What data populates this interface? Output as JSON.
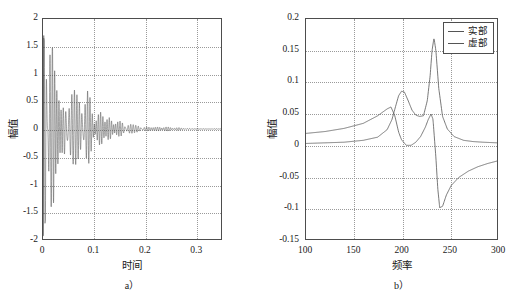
{
  "figure": {
    "background": "#ffffff",
    "axis_color": "#4d4d4d",
    "grid_color": "#9a9a9a",
    "curve_color": "#555555"
  },
  "chart_data": [
    {
      "type": "line",
      "panel": "a",
      "caption": "a）",
      "title": "",
      "xlabel": "时间",
      "ylabel": "幅值",
      "xlim": [
        0,
        0.35
      ],
      "ylim": [
        -2,
        2
      ],
      "xticks": [
        0,
        0.1,
        0.2,
        0.3
      ],
      "xticklabels": [
        "0",
        "0.1",
        "0.2",
        "0.3"
      ],
      "yticks": [
        -2,
        -1.5,
        -1,
        -0.5,
        0,
        0.5,
        1,
        1.5,
        2
      ],
      "yticklabels": [
        "-2",
        "-1.5",
        "-1",
        "-0.5",
        "0",
        "0.5",
        "1",
        "1.5",
        "2"
      ],
      "grid": true,
      "legend": null,
      "description": "Damped multi-frequency beating time response; envelope decays from about +1.7 / -1.95 at t=0 to roughly +-0.1 at t=0.35",
      "series": [
        {
          "name": "时域响应",
          "envelope_x": [
            0.0,
            0.01,
            0.02,
            0.03,
            0.04,
            0.05,
            0.06,
            0.07,
            0.08,
            0.09,
            0.1,
            0.12,
            0.14,
            0.16,
            0.18,
            0.2,
            0.22,
            0.24,
            0.26,
            0.28,
            0.3,
            0.32,
            0.35
          ],
          "envelope_upper": [
            1.7,
            1.35,
            1.5,
            1.48,
            1.1,
            1.35,
            1.3,
            1.05,
            1.15,
            0.95,
            0.72,
            0.6,
            0.58,
            0.42,
            0.52,
            0.3,
            0.26,
            0.25,
            0.22,
            0.2,
            0.16,
            0.14,
            0.11
          ],
          "envelope_lower": [
            -1.95,
            -1.35,
            -1.45,
            -1.5,
            -1.38,
            -1.2,
            -1.2,
            -1.05,
            -0.92,
            -0.88,
            -0.7,
            -0.58,
            -0.55,
            -0.4,
            -0.48,
            -0.3,
            -0.25,
            -0.24,
            -0.21,
            -0.19,
            -0.16,
            -0.14,
            -0.11
          ]
        }
      ]
    },
    {
      "type": "line",
      "panel": "b",
      "caption": "b）",
      "title": "",
      "xlabel": "频率",
      "ylabel": "幅值",
      "xlim": [
        100,
        300
      ],
      "ylim": [
        -0.15,
        0.2
      ],
      "xticks": [
        100,
        150,
        200,
        250,
        300
      ],
      "xticklabels": [
        "100",
        "150",
        "200",
        "250",
        "300"
      ],
      "yticks": [
        -0.15,
        -0.1,
        -0.05,
        0,
        0.05,
        0.1,
        0.15,
        0.2
      ],
      "yticklabels": [
        "-0.15",
        "-0.1",
        "-0.05",
        "0",
        "0.05",
        "0.1",
        "0.15",
        "0.2"
      ],
      "grid": true,
      "legend": {
        "position": "top-right",
        "entries": [
          "实部",
          "虚部"
        ]
      },
      "series": [
        {
          "name": "实部",
          "x": [
            100,
            120,
            140,
            160,
            175,
            185,
            189,
            193,
            197,
            200,
            205,
            210,
            215,
            220,
            225,
            228,
            231,
            233,
            236,
            238,
            240,
            243,
            247,
            252,
            260,
            270,
            280,
            290,
            300
          ],
          "y": [
            0.018,
            0.021,
            0.026,
            0.034,
            0.046,
            0.057,
            0.06,
            0.046,
            0.02,
            0.008,
            -0.001,
            -0.001,
            0.004,
            0.013,
            0.028,
            0.04,
            0.049,
            0.04,
            -0.02,
            -0.07,
            -0.1,
            -0.098,
            -0.08,
            -0.065,
            -0.052,
            -0.042,
            -0.035,
            -0.03,
            -0.026
          ]
        },
        {
          "name": "虚部",
          "x": [
            100,
            120,
            140,
            160,
            175,
            185,
            190,
            194,
            197,
            200,
            203,
            207,
            211,
            215,
            219,
            223,
            227,
            230,
            232,
            234,
            236,
            239,
            243,
            248,
            255,
            265,
            275,
            285,
            300
          ],
          "y": [
            0.002,
            0.003,
            0.004,
            0.007,
            0.012,
            0.024,
            0.04,
            0.062,
            0.078,
            0.085,
            0.084,
            0.07,
            0.055,
            0.047,
            0.045,
            0.046,
            0.07,
            0.11,
            0.15,
            0.17,
            0.15,
            0.09,
            0.045,
            0.025,
            0.013,
            0.007,
            0.005,
            0.004,
            0.003
          ]
        }
      ]
    }
  ]
}
